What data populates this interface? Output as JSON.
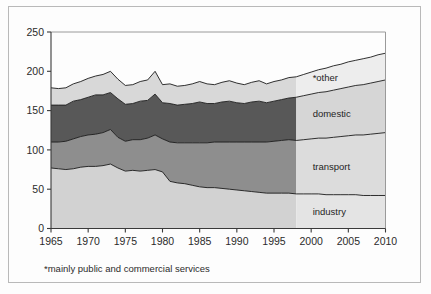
{
  "chart_data": {
    "type": "area",
    "stacked": true,
    "title": "",
    "subtitle": "",
    "xlabel": "",
    "ylabel": "",
    "xlim": [
      1965,
      2010
    ],
    "ylim": [
      0,
      250
    ],
    "grid": false,
    "legend_position": "inline-right",
    "y_ticks": [
      0,
      50,
      100,
      150,
      200,
      250
    ],
    "x_ticks": [
      1965,
      1970,
      1975,
      1980,
      1985,
      1990,
      1995,
      2000,
      2005,
      2010
    ],
    "x": [
      1965,
      1966,
      1967,
      1968,
      1969,
      1970,
      1971,
      1972,
      1973,
      1974,
      1975,
      1976,
      1977,
      1978,
      1979,
      1980,
      1981,
      1982,
      1983,
      1984,
      1985,
      1986,
      1987,
      1988,
      1989,
      1990,
      1991,
      1992,
      1993,
      1994,
      1995,
      1996,
      1997,
      1998,
      1999,
      2000,
      2001,
      2002,
      2003,
      2004,
      2005,
      2006,
      2007,
      2008,
      2009,
      2010
    ],
    "forecast_start_year": 1998,
    "series": [
      {
        "name": "industry",
        "label": "industry",
        "color": "#d2d2d2",
        "forecast_color": "#e4e4e4",
        "values": [
          77,
          76,
          75,
          76,
          78,
          79,
          79,
          80,
          82,
          77,
          73,
          74,
          73,
          74,
          75,
          72,
          60,
          58,
          57,
          55,
          53,
          52,
          52,
          51,
          50,
          49,
          48,
          47,
          46,
          45,
          45,
          45,
          45,
          44,
          44,
          44,
          44,
          43,
          43,
          43,
          43,
          43,
          42,
          42,
          42,
          42
        ]
      },
      {
        "name": "transport",
        "label": "transport",
        "color": "#8e8e8e",
        "forecast_color": "#dcdcdc",
        "values": [
          33,
          34,
          36,
          38,
          39,
          40,
          41,
          42,
          44,
          39,
          38,
          39,
          40,
          41,
          44,
          42,
          50,
          51,
          52,
          54,
          56,
          57,
          58,
          59,
          60,
          61,
          62,
          63,
          64,
          65,
          66,
          67,
          68,
          68,
          69,
          70,
          71,
          72,
          73,
          74,
          75,
          76,
          77,
          78,
          79,
          80
        ]
      },
      {
        "name": "domestic",
        "label": "domestic",
        "color": "#585858",
        "forecast_color": "#d6d6d6",
        "values": [
          47,
          47,
          46,
          48,
          47,
          48,
          50,
          48,
          47,
          49,
          47,
          46,
          49,
          48,
          52,
          46,
          49,
          48,
          49,
          50,
          52,
          50,
          49,
          51,
          52,
          50,
          49,
          51,
          52,
          50,
          51,
          52,
          53,
          55,
          56,
          57,
          58,
          59,
          60,
          61,
          62,
          63,
          64,
          65,
          66,
          67
        ]
      },
      {
        "name": "other",
        "label": "*other",
        "color": "#d8d8d8",
        "forecast_color": "#ededed",
        "values": [
          22,
          21,
          22,
          22,
          23,
          24,
          24,
          26,
          27,
          25,
          24,
          24,
          25,
          26,
          29,
          23,
          25,
          24,
          24,
          25,
          26,
          25,
          24,
          25,
          26,
          25,
          24,
          25,
          26,
          24,
          25,
          25,
          26,
          26,
          27,
          28,
          29,
          30,
          31,
          31,
          32,
          32,
          33,
          33,
          34,
          34
        ]
      }
    ],
    "footnote": "*mainly public and commercial services"
  }
}
